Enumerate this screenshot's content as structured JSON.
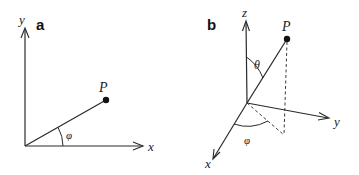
{
  "figure": {
    "panels": [
      {
        "id": "a",
        "label": "a",
        "type": "2D polar coordinates",
        "axes": {
          "x": "x",
          "y": "y"
        },
        "point": "P",
        "angles": {
          "azimuth": "φ"
        }
      },
      {
        "id": "b",
        "label": "b",
        "type": "3D spherical coordinates",
        "axes": {
          "x": "x",
          "y": "y",
          "z": "z"
        },
        "point": "P",
        "angles": {
          "polar": "θ",
          "azimuth": "φ"
        }
      }
    ]
  },
  "colors": {
    "ink": "#2a2a2a",
    "background": "#ffffff"
  }
}
